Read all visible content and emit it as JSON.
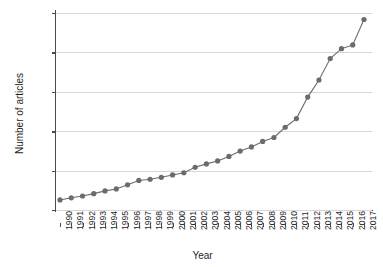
{
  "chart_data": {
    "type": "line",
    "title": "",
    "xlabel": "Year",
    "ylabel": "Number of articles",
    "xlim": [
      1990,
      2017
    ],
    "ylim": [
      0,
      5000
    ],
    "yticks": [
      0,
      1000,
      2000,
      3000,
      4000,
      5000
    ],
    "ytick_labels": [
      "0",
      "1000",
      "2000",
      "3000",
      "4000",
      "5000"
    ],
    "grid": "horizontal",
    "legend": "none",
    "marker": "circle",
    "series_color": "#6b6b6b",
    "grid_color": "#d6d6d6",
    "axis_color": "#4a4a4a",
    "categories": [
      "1990",
      "1991",
      "1992",
      "1993",
      "1994",
      "1995",
      "1996",
      "1997",
      "1998",
      "1999",
      "2000",
      "2001",
      "2002",
      "2003",
      "2004",
      "2005",
      "2006",
      "2007",
      "2008",
      "2009",
      "2010",
      "2011",
      "2012",
      "2013",
      "2014",
      "2015",
      "2016",
      "2017"
    ],
    "x": [
      1990,
      1991,
      1992,
      1993,
      1994,
      1995,
      1996,
      1997,
      1998,
      1999,
      2000,
      2001,
      2002,
      2003,
      2004,
      2005,
      2006,
      2007,
      2008,
      2009,
      2010,
      2011,
      2012,
      2013,
      2014,
      2015,
      2016,
      2017
    ],
    "values": [
      255,
      310,
      355,
      415,
      485,
      535,
      640,
      750,
      780,
      830,
      890,
      945,
      1085,
      1170,
      1245,
      1360,
      1495,
      1600,
      1740,
      1840,
      2100,
      2320,
      2865,
      3300,
      3845,
      4095,
      4190,
      4835
    ],
    "series": [
      {
        "name": "Number of articles",
        "values": [
          255,
          310,
          355,
          415,
          485,
          535,
          640,
          750,
          780,
          830,
          890,
          945,
          1085,
          1170,
          1245,
          1360,
          1495,
          1600,
          1740,
          1840,
          2100,
          2320,
          2865,
          3300,
          3845,
          4095,
          4190,
          4835
        ]
      }
    ]
  }
}
